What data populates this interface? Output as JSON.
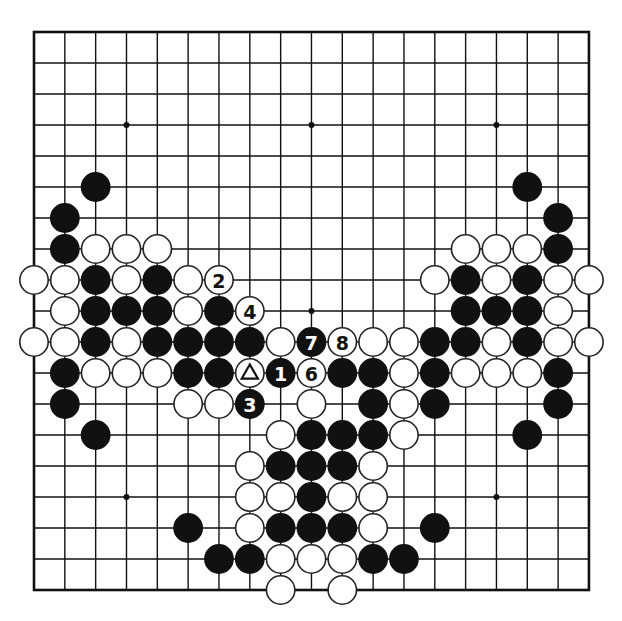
{
  "board": {
    "size": 19,
    "origin_x": 34,
    "origin_y": 32,
    "spacing_x": 30.83,
    "spacing_y": 31,
    "stone_radius": 14.2,
    "colors": {
      "line": "#111111",
      "black": "#111111",
      "white": "#ffffff",
      "background": "#ffffff"
    },
    "star_points": [
      [
        3,
        3
      ],
      [
        9,
        3
      ],
      [
        15,
        3
      ],
      [
        3,
        9
      ],
      [
        9,
        9
      ],
      [
        15,
        9
      ],
      [
        3,
        15
      ],
      [
        9,
        15
      ],
      [
        15,
        15
      ]
    ],
    "stones": {
      "black": [
        [
          2,
          5
        ],
        [
          16,
          5
        ],
        [
          1,
          6
        ],
        [
          17,
          6
        ],
        [
          1,
          7
        ],
        [
          17,
          7
        ],
        [
          2,
          8
        ],
        [
          4,
          8
        ],
        [
          14,
          8
        ],
        [
          16,
          8
        ],
        [
          2,
          9
        ],
        [
          3,
          9
        ],
        [
          4,
          9
        ],
        [
          6,
          9
        ],
        [
          14,
          9
        ],
        [
          15,
          9
        ],
        [
          16,
          9
        ],
        [
          2,
          10
        ],
        [
          4,
          10
        ],
        [
          5,
          10
        ],
        [
          6,
          10
        ],
        [
          7,
          10
        ],
        [
          13,
          10
        ],
        [
          14,
          10
        ],
        [
          16,
          10
        ],
        [
          1,
          11
        ],
        [
          5,
          11
        ],
        [
          6,
          11
        ],
        [
          10,
          11
        ],
        [
          11,
          11
        ],
        [
          13,
          11
        ],
        [
          17,
          11
        ],
        [
          1,
          12
        ],
        [
          11,
          12
        ],
        [
          13,
          12
        ],
        [
          17,
          12
        ],
        [
          2,
          13
        ],
        [
          9,
          13
        ],
        [
          10,
          13
        ],
        [
          11,
          13
        ],
        [
          16,
          13
        ],
        [
          8,
          14
        ],
        [
          9,
          14
        ],
        [
          10,
          14
        ],
        [
          9,
          15
        ],
        [
          5,
          16
        ],
        [
          8,
          16
        ],
        [
          9,
          16
        ],
        [
          10,
          16
        ],
        [
          13,
          16
        ],
        [
          6,
          17
        ],
        [
          7,
          17
        ],
        [
          11,
          17
        ],
        [
          12,
          17
        ]
      ],
      "white": [
        [
          2,
          7
        ],
        [
          3,
          7
        ],
        [
          4,
          7
        ],
        [
          14,
          7
        ],
        [
          15,
          7
        ],
        [
          16,
          7
        ],
        [
          0,
          8
        ],
        [
          1,
          8
        ],
        [
          3,
          8
        ],
        [
          5,
          8
        ],
        [
          13,
          8
        ],
        [
          15,
          8
        ],
        [
          17,
          8
        ],
        [
          18,
          8
        ],
        [
          1,
          9
        ],
        [
          5,
          9
        ],
        [
          17,
          9
        ],
        [
          0,
          10
        ],
        [
          1,
          10
        ],
        [
          3,
          10
        ],
        [
          8,
          10
        ],
        [
          11,
          10
        ],
        [
          12,
          10
        ],
        [
          15,
          10
        ],
        [
          17,
          10
        ],
        [
          18,
          10
        ],
        [
          2,
          11
        ],
        [
          3,
          11
        ],
        [
          4,
          11
        ],
        [
          12,
          11
        ],
        [
          14,
          11
        ],
        [
          15,
          11
        ],
        [
          16,
          11
        ],
        [
          5,
          12
        ],
        [
          6,
          12
        ],
        [
          9,
          12
        ],
        [
          12,
          12
        ],
        [
          8,
          13
        ],
        [
          12,
          13
        ],
        [
          7,
          14
        ],
        [
          11,
          14
        ],
        [
          7,
          15
        ],
        [
          8,
          15
        ],
        [
          10,
          15
        ],
        [
          11,
          15
        ],
        [
          7,
          16
        ],
        [
          11,
          16
        ],
        [
          8,
          17
        ],
        [
          9,
          17
        ],
        [
          10,
          17
        ],
        [
          8,
          18
        ],
        [
          10,
          18
        ]
      ]
    },
    "numbered_moves": [
      {
        "number": "1",
        "color": "black",
        "col": 8,
        "row": 11
      },
      {
        "number": "2",
        "color": "white",
        "col": 6,
        "row": 8
      },
      {
        "number": "3",
        "color": "black",
        "col": 7,
        "row": 12
      },
      {
        "number": "4",
        "color": "white",
        "col": 7,
        "row": 9
      },
      {
        "number": "6",
        "color": "white",
        "col": 9,
        "row": 11
      },
      {
        "number": "7",
        "color": "black",
        "col": 9,
        "row": 10
      },
      {
        "number": "8",
        "color": "white",
        "col": 10,
        "row": 10
      }
    ],
    "marked_stones": [
      {
        "marker": "triangle",
        "color": "white",
        "col": 7,
        "row": 11
      }
    ]
  }
}
